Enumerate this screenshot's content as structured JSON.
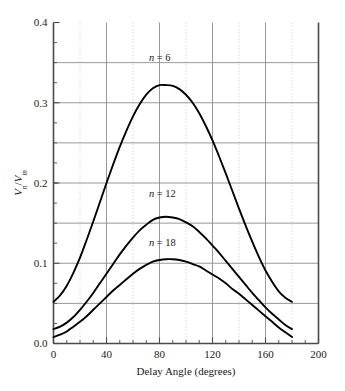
{
  "chart_data": {
    "type": "line",
    "title": "",
    "xlabel": "Delay Angle (degrees)",
    "ylabel": "Vₙ/Vₘ",
    "ylabel_parts": {
      "num": "V",
      "num_sub": "n",
      "slash": "/",
      "den": "V",
      "den_sub": "m"
    },
    "xlim": [
      0,
      200
    ],
    "ylim": [
      0.0,
      0.4
    ],
    "x_ticks": [
      0,
      40,
      80,
      120,
      160,
      200
    ],
    "x_tick_labels": [
      "0",
      "40",
      "80",
      "120",
      "160",
      "200"
    ],
    "x_minor_step": 20,
    "y_ticks": [
      0.0,
      0.1,
      0.2,
      0.3,
      0.4
    ],
    "y_tick_labels": [
      "0.0",
      "0.1",
      "0.2",
      "0.3",
      "0.4"
    ],
    "y_gridline_step": 0.05,
    "y_minor_step": 0.025,
    "grid": true,
    "grid_major_color": "#8d8d8d",
    "grid_minor_color": "#cfcfcf",
    "axis_color": "#4a4a4a",
    "curve_color": "#000000",
    "legend": "inline-annotations",
    "x": [
      0,
      5,
      10,
      15,
      20,
      25,
      30,
      35,
      40,
      45,
      50,
      55,
      60,
      65,
      70,
      75,
      80,
      85,
      90,
      95,
      100,
      105,
      110,
      115,
      120,
      125,
      130,
      135,
      140,
      145,
      150,
      155,
      160,
      165,
      170,
      175,
      180
    ],
    "series": [
      {
        "name": "n = 6",
        "label_n": "n",
        "label_eq": "= 6",
        "label_x": 72,
        "label_y": 0.352,
        "values": [
          0.052,
          0.06,
          0.072,
          0.088,
          0.107,
          0.129,
          0.152,
          0.176,
          0.2,
          0.223,
          0.245,
          0.265,
          0.283,
          0.298,
          0.31,
          0.318,
          0.322,
          0.322,
          0.321,
          0.317,
          0.31,
          0.3,
          0.287,
          0.271,
          0.253,
          0.233,
          0.212,
          0.19,
          0.168,
          0.147,
          0.127,
          0.108,
          0.091,
          0.077,
          0.065,
          0.057,
          0.052
        ]
      },
      {
        "name": "n = 12",
        "label_n": "n",
        "label_eq": "= 12",
        "label_x": 72,
        "label_y": 0.182,
        "values": [
          0.018,
          0.021,
          0.026,
          0.033,
          0.042,
          0.052,
          0.063,
          0.075,
          0.087,
          0.099,
          0.111,
          0.122,
          0.132,
          0.141,
          0.148,
          0.154,
          0.157,
          0.158,
          0.157,
          0.155,
          0.151,
          0.146,
          0.139,
          0.131,
          0.122,
          0.113,
          0.103,
          0.093,
          0.083,
          0.073,
          0.063,
          0.054,
          0.045,
          0.037,
          0.03,
          0.023,
          0.018
        ]
      },
      {
        "name": "n = 18",
        "label_n": "n",
        "label_eq": "= 18",
        "label_x": 72,
        "label_y": 0.122,
        "values": [
          0.008,
          0.011,
          0.015,
          0.021,
          0.027,
          0.034,
          0.042,
          0.05,
          0.058,
          0.066,
          0.073,
          0.08,
          0.087,
          0.093,
          0.098,
          0.102,
          0.104,
          0.105,
          0.105,
          0.104,
          0.102,
          0.099,
          0.096,
          0.091,
          0.086,
          0.081,
          0.075,
          0.068,
          0.062,
          0.055,
          0.048,
          0.041,
          0.034,
          0.027,
          0.02,
          0.014,
          0.008
        ]
      }
    ]
  }
}
